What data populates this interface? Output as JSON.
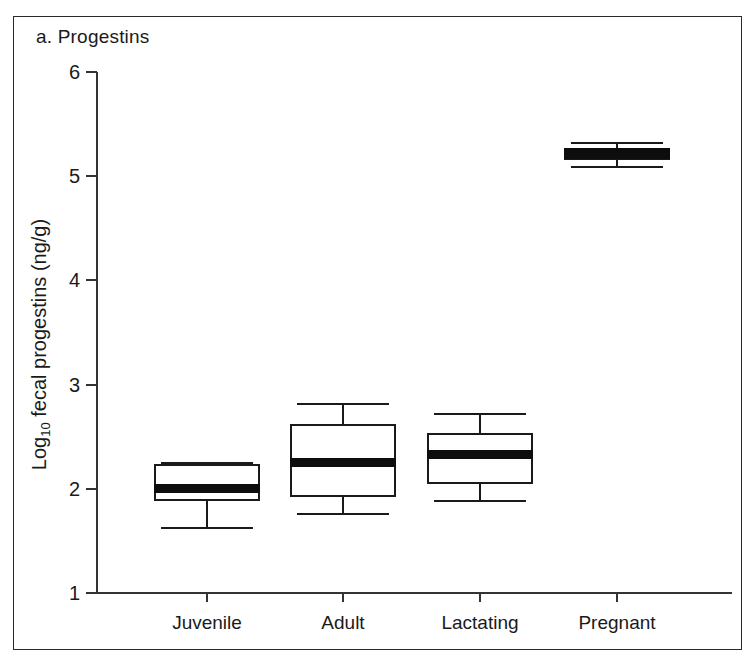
{
  "figure": {
    "panel_label": "a. Progestins"
  },
  "chart_data": {
    "type": "box",
    "title": "a. Progestins",
    "xlabel": "",
    "ylabel": "Log10 fecal progestins (ng/g)",
    "ylabel_base": "Log",
    "ylabel_sub": "10",
    "ylabel_rest": " fecal progestins (ng/g)",
    "ylim": [
      1,
      6
    ],
    "yticks": [
      1,
      2,
      3,
      4,
      5,
      6
    ],
    "ytick_labels": [
      "1",
      "2",
      "3",
      "4",
      "5",
      "6"
    ],
    "grid": false,
    "legend": "none",
    "categories": [
      "Juvenile",
      "Adult",
      "Lactating",
      "Pregnant"
    ],
    "boxes": [
      {
        "category": "Juvenile",
        "whisker_low": 1.63,
        "q1": 1.88,
        "median": 2.0,
        "q3": 2.24,
        "whisker_high": 2.26
      },
      {
        "category": "Adult",
        "whisker_low": 1.77,
        "q1": 1.92,
        "median": 2.25,
        "q3": 2.62,
        "whisker_high": 2.82
      },
      {
        "category": "Lactating",
        "whisker_low": 1.89,
        "q1": 2.05,
        "median": 2.33,
        "q3": 2.54,
        "whisker_high": 2.73
      },
      {
        "category": "Pregnant",
        "whisker_low": 5.1,
        "q1": 5.16,
        "median": 5.22,
        "q3": 5.26,
        "whisker_high": 5.33
      }
    ]
  },
  "colors": {
    "axis": "#333333",
    "box_outline": "#1a1a1a",
    "median": "#0d0d0d",
    "background": "#ffffff",
    "frame": "#2b2b2b"
  }
}
